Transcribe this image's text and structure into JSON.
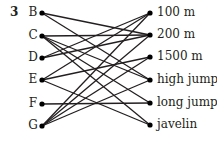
{
  "question_number": "3",
  "left_items": [
    {
      "label": "B",
      "y": 13
    },
    {
      "label": "C",
      "y": 36
    },
    {
      "label": "D",
      "y": 58
    },
    {
      "label": "E",
      "y": 80
    },
    {
      "label": "F",
      "y": 104
    },
    {
      "label": "G",
      "y": 126
    }
  ],
  "right_items": [
    {
      "label": "100 m",
      "y": 13
    },
    {
      "label": "200 m",
      "y": 35
    },
    {
      "label": "1500 m",
      "y": 57
    },
    {
      "label": "high jump",
      "y": 80
    },
    {
      "label": "long jump",
      "y": 103
    },
    {
      "label": "javelin",
      "y": 125
    }
  ],
  "connections": [
    [
      "B",
      "200 m"
    ],
    [
      "B",
      "high jump"
    ],
    [
      "C",
      "200 m"
    ],
    [
      "C",
      "high jump"
    ],
    [
      "C",
      "long jump"
    ],
    [
      "C",
      "javelin"
    ],
    [
      "D",
      "100 m"
    ],
    [
      "D",
      "200 m"
    ],
    [
      "E",
      "100 m"
    ],
    [
      "E",
      "1500 m"
    ],
    [
      "E",
      "javelin"
    ],
    [
      "F",
      "long jump"
    ],
    [
      "G",
      "100 m"
    ],
    [
      "G",
      "200 m"
    ],
    [
      "G",
      "1500 m"
    ],
    [
      "G",
      "high jump"
    ]
  ],
  "colors": {
    "line": "#231f20",
    "dot": "#000000"
  }
}
